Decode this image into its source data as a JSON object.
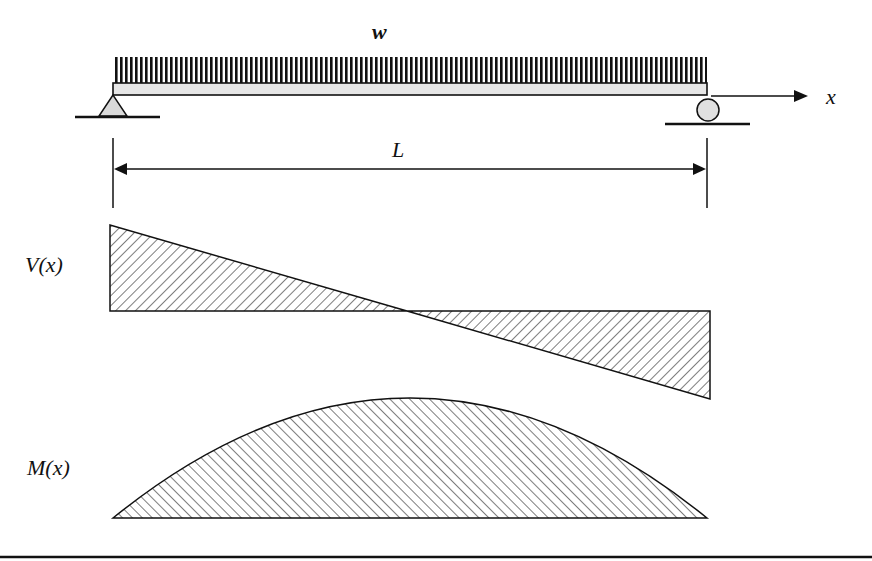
{
  "diagram": {
    "labels": {
      "load": "w",
      "axis": "x",
      "span": "L",
      "shear": "V(x)",
      "moment": "M(x)"
    },
    "components": {
      "beam": "simply supported beam",
      "left_support": "pin support",
      "right_support": "roller support",
      "load_type": "uniformly distributed load"
    },
    "colors": {
      "ink": "#111111",
      "beam_fill": "#e6e6e6",
      "support_fill": "#d9d9d9",
      "background": "#ffffff"
    }
  }
}
